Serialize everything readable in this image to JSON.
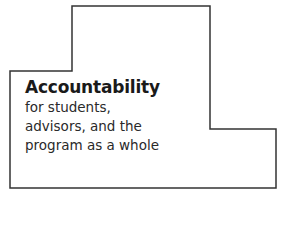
{
  "diagram": {
    "shape": "stepped-outline",
    "stroke_color": "#333333",
    "heading": "Accountability",
    "lines": [
      "for students,",
      "advisors, and the",
      "program as a whole"
    ]
  }
}
